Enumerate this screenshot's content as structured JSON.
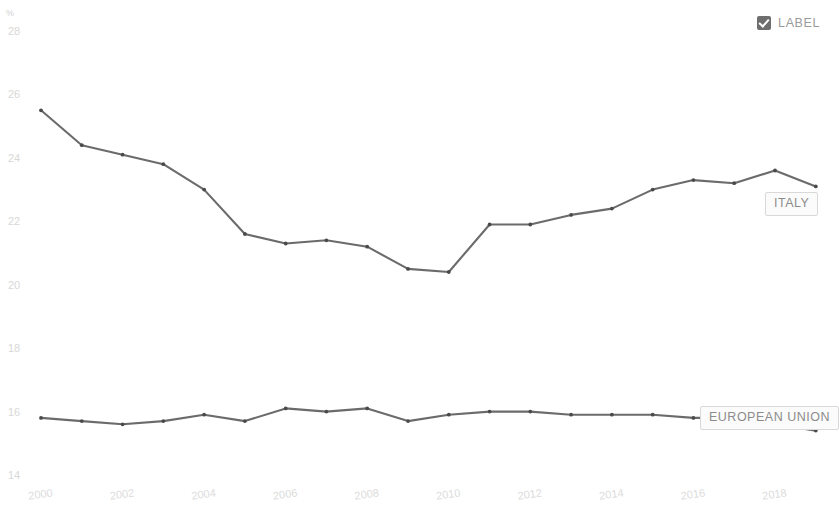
{
  "legend": {
    "checkbox_checked": true,
    "label": "LABEL",
    "checkbox_icon": "checkbox-checked-icon"
  },
  "axis": {
    "unit_symbol": "%",
    "y_ticks": [
      "28",
      "26",
      "24",
      "22",
      "20",
      "18",
      "16",
      "14"
    ],
    "x_ticks": [
      "2000",
      "2002",
      "2004",
      "2006",
      "2008",
      "2010",
      "2012",
      "2014",
      "2016",
      "2018"
    ]
  },
  "series_labels": {
    "italy": "ITALY",
    "european_union": "EUROPEAN UNION"
  },
  "colors": {
    "line": "#6b6b6b",
    "marker": "#4a4a4a",
    "tick_text": "#d8d8d8",
    "label_border": "#d9d9d9",
    "label_text": "#8c8c8c",
    "checkbox": "#6e6e6e",
    "background": "#ffffff"
  },
  "chart_data": {
    "type": "line",
    "title": "",
    "subtitle": "",
    "xlabel": "",
    "ylabel": "%",
    "xlim": [
      2000,
      2019
    ],
    "ylim": [
      14,
      28
    ],
    "grid": false,
    "legend_position": "inline-right",
    "x": [
      2000,
      2001,
      2002,
      2003,
      2004,
      2005,
      2006,
      2007,
      2008,
      2009,
      2010,
      2011,
      2012,
      2013,
      2014,
      2015,
      2016,
      2017,
      2018,
      2019
    ],
    "series": [
      {
        "name": "ITALY",
        "color": "#6b6b6b",
        "values": [
          25.5,
          24.4,
          24.1,
          23.8,
          23.0,
          21.6,
          21.3,
          21.4,
          21.2,
          20.5,
          20.4,
          21.9,
          21.9,
          22.2,
          22.4,
          23.0,
          23.3,
          23.2,
          23.6,
          23.1
        ]
      },
      {
        "name": "EUROPEAN UNION",
        "color": "#6b6b6b",
        "values": [
          15.8,
          15.7,
          15.6,
          15.7,
          15.9,
          15.7,
          16.1,
          16.0,
          16.1,
          15.7,
          15.9,
          16.0,
          16.0,
          15.9,
          15.9,
          15.9,
          15.8,
          15.8,
          15.6,
          15.4
        ]
      }
    ]
  }
}
